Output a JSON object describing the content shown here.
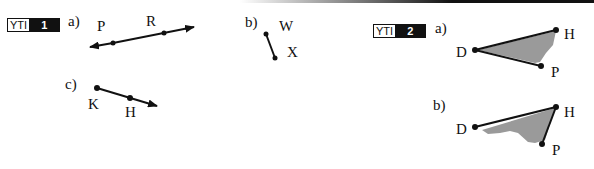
{
  "yti1": {
    "badge_label": "YTI",
    "badge_number": "1",
    "parts": {
      "a": {
        "label": "a)",
        "type": "line",
        "points": [
          "P",
          "R"
        ]
      },
      "b": {
        "label": "b)",
        "type": "segment",
        "points": [
          "W",
          "X"
        ]
      },
      "c": {
        "label": "c)",
        "type": "ray",
        "points": [
          "K",
          "H"
        ]
      }
    }
  },
  "yti2": {
    "badge_label": "YTI",
    "badge_number": "2",
    "parts": {
      "a": {
        "label": "a)",
        "type": "angle",
        "points": [
          "D",
          "H",
          "P"
        ],
        "vertex": "D"
      },
      "b": {
        "label": "b)",
        "type": "angle",
        "points": [
          "D",
          "H",
          "P"
        ],
        "vertex": "H"
      }
    }
  },
  "colors": {
    "ink": "#111111",
    "shade": "#9a9a9a",
    "badge_bg": "#111111"
  }
}
